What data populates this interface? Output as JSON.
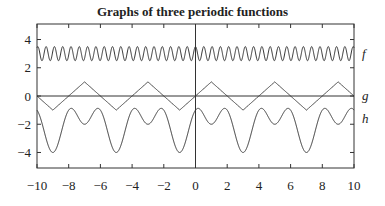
{
  "chart_data": {
    "type": "line",
    "title": "Graphs of three periodic functions",
    "xlabel": "",
    "ylabel": "",
    "xlim": [
      -10,
      10
    ],
    "ylim": [
      -5.1,
      5.1
    ],
    "grid": false,
    "legend": "labels at right edge",
    "x_ticks": [
      -10,
      -8,
      -6,
      -4,
      -2,
      0,
      2,
      4,
      6,
      8,
      10
    ],
    "x_tick_labels": [
      "−10",
      "−8",
      "−6",
      "−4",
      "−2",
      "0",
      "2",
      "4",
      "6",
      "8",
      "10"
    ],
    "y_ticks": [
      4,
      2,
      0,
      -2,
      -4
    ],
    "y_tick_labels": [
      "4",
      "2",
      "0",
      "−2",
      "−4"
    ],
    "series": [
      {
        "name": "f",
        "label": "f",
        "label_y": 3,
        "description": "fast oscillation between about 2.5 and 3.5, period about 0.52",
        "expr": "3 + 0.5*cos(12x)",
        "min": 2.5,
        "max": 3.5
      },
      {
        "name": "g",
        "label": "g",
        "label_y": 0,
        "description": "triangle wave, amplitude 1, period 4, g(0)=0, g(1)=1, g(-1)=-1",
        "expr": "triangle(x), period 4",
        "min": -1,
        "max": 1
      },
      {
        "name": "h",
        "label": "h",
        "label_y": -1.6,
        "description": "period 4; minima -4 at x=-9,-5,-1,3,7; local minima -2 at x=-7,-3,1,5,9; peaks about -1 at even x",
        "expr": "-2 + cos(pi x) - cos(pi (x-3)/2)",
        "min": -4,
        "max": -1
      }
    ],
    "reference_lines": {
      "x0": true,
      "y0": true
    }
  }
}
